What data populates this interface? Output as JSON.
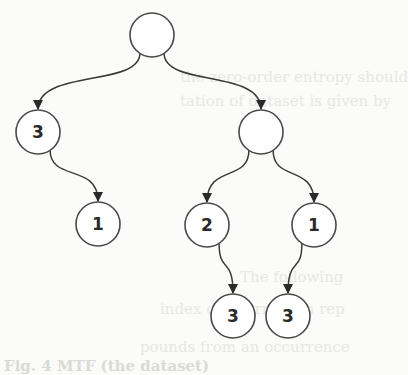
{
  "diagram": {
    "type": "binary-tree",
    "colors": {
      "stroke": "#4a4a4a",
      "fill": "#ffffff",
      "label": "#2a2a2a",
      "background": "#fbfbf9"
    },
    "nodes": [
      {
        "id": "root",
        "label": "",
        "cx": 152,
        "cy": 35
      },
      {
        "id": "left",
        "label": "3",
        "cx": 38,
        "cy": 132
      },
      {
        "id": "left-right",
        "label": "1",
        "cx": 98,
        "cy": 224
      },
      {
        "id": "right",
        "label": "",
        "cx": 261,
        "cy": 132
      },
      {
        "id": "right-left",
        "label": "2",
        "cx": 207,
        "cy": 225
      },
      {
        "id": "right-right",
        "label": "1",
        "cx": 314,
        "cy": 225
      },
      {
        "id": "right-left-child",
        "label": "3",
        "cx": 233,
        "cy": 316
      },
      {
        "id": "right-right-child",
        "label": "3",
        "cx": 288,
        "cy": 316
      }
    ],
    "edges": [
      {
        "from": "root",
        "to": "left"
      },
      {
        "from": "root",
        "to": "right"
      },
      {
        "from": "left",
        "to": "left-right"
      },
      {
        "from": "right",
        "to": "right-left"
      },
      {
        "from": "right",
        "to": "right-right"
      },
      {
        "from": "right-left",
        "to": "right-left-child"
      },
      {
        "from": "right-right",
        "to": "right-right-child"
      }
    ]
  },
  "ghost_text": {
    "line1": "the zero-order entropy should",
    "line2": "tation of dataset is given by",
    "line3": "The following",
    "line4": "index of information rep",
    "line5": "pounds from an occurrence",
    "line6": "Fig. 4   MTF (the dataset)"
  }
}
